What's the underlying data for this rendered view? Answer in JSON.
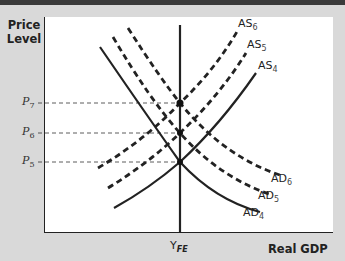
{
  "axes": {
    "y_label_line1": "Price",
    "y_label_line2": "Level",
    "x_label": "Real GDP",
    "x_tick": {
      "base": "Y",
      "sub": "FE"
    }
  },
  "price_levels": [
    {
      "base": "P",
      "sub": "7"
    },
    {
      "base": "P",
      "sub": "6"
    },
    {
      "base": "P",
      "sub": "5"
    }
  ],
  "curves": {
    "as": [
      {
        "base": "AS",
        "sub": "6",
        "style": "dashed"
      },
      {
        "base": "AS",
        "sub": "5",
        "style": "dashed"
      },
      {
        "base": "AS",
        "sub": "4",
        "style": "solid"
      }
    ],
    "ad": [
      {
        "base": "AD",
        "sub": "6",
        "style": "dashed"
      },
      {
        "base": "AD",
        "sub": "5",
        "style": "dashed"
      },
      {
        "base": "AD",
        "sub": "4",
        "style": "solid"
      }
    ]
  },
  "colors": {
    "curve": "#222222",
    "plot_bg": "#ffffff",
    "frame_bg": "#d9d9d9"
  }
}
